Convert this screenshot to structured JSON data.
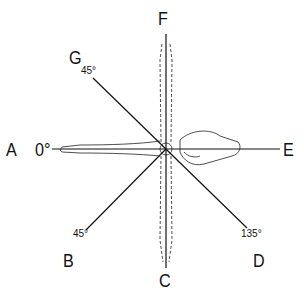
{
  "diagram": {
    "type": "range-of-motion-diagram",
    "labels": {
      "A": "A",
      "B": "B",
      "C": "C",
      "D": "D",
      "E": "E",
      "F": "F",
      "G": "G"
    },
    "angles": {
      "a": "0°",
      "g": "45°",
      "b": "45°",
      "d": "135°"
    },
    "colors": {
      "line": "#111111",
      "background": "#ffffff"
    }
  }
}
